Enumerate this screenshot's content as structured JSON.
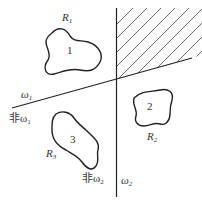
{
  "diagram": {
    "type": "decision-regions",
    "colors": {
      "stroke": "#222222",
      "hatch": "#444444",
      "text": "#333333",
      "background": "#ffffff"
    },
    "boundaries": [
      {
        "id": "w1",
        "label": "ω",
        "subscript": "1",
        "negated_label": "非ω",
        "negated_subscript": "1"
      },
      {
        "id": "w2",
        "label": "ω",
        "subscript": "2",
        "negated_label": "非ω",
        "negated_subscript": "2"
      }
    ],
    "regions": [
      {
        "id": "R1",
        "number": "1",
        "label": "R",
        "subscript": "1"
      },
      {
        "id": "R2",
        "number": "2",
        "label": "R",
        "subscript": "2"
      },
      {
        "id": "R3",
        "number": "3",
        "label": "R",
        "subscript": "3"
      }
    ],
    "hatched_area": "indeterminate region (upper right)"
  }
}
